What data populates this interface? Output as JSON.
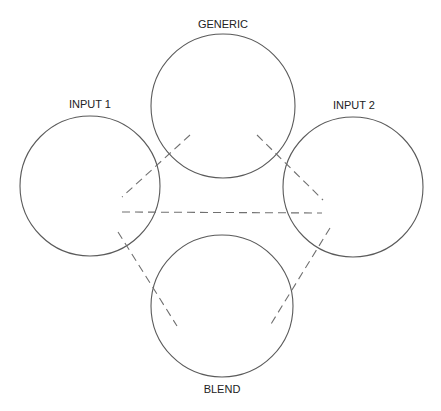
{
  "diagram": {
    "nodes": [
      {
        "id": "generic",
        "label": "GENERIC",
        "cx": 223,
        "cy": 106,
        "r": 72,
        "label_x": 223,
        "label_y": 28
      },
      {
        "id": "input1",
        "label": "INPUT 1",
        "cx": 90,
        "cy": 186,
        "r": 70,
        "label_x": 90,
        "label_y": 108
      },
      {
        "id": "input2",
        "label": "INPUT 2",
        "cx": 353,
        "cy": 187,
        "r": 70,
        "label_x": 354,
        "label_y": 109
      },
      {
        "id": "blend",
        "label": "BLEND",
        "cx": 222,
        "cy": 306,
        "r": 71,
        "label_x": 222,
        "label_y": 393
      }
    ],
    "connectors": [
      {
        "id": "generic-input1",
        "from": [
          190,
          135
        ],
        "to": [
          122,
          197
        ]
      },
      {
        "id": "generic-input2",
        "from": [
          257,
          135
        ],
        "to": [
          323,
          200
        ]
      },
      {
        "id": "input1-input2",
        "from": [
          122,
          212
        ],
        "to": [
          322,
          213
        ]
      },
      {
        "id": "input1-blend",
        "from": [
          118,
          232
        ],
        "to": [
          177,
          326
        ]
      },
      {
        "id": "input2-blend",
        "from": [
          330,
          228
        ],
        "to": [
          271,
          324
        ]
      }
    ],
    "colors": {
      "circle_stroke": "#5a5a5a",
      "dash_stroke": "#707070",
      "text": "#222222",
      "background": "#ffffff"
    }
  }
}
